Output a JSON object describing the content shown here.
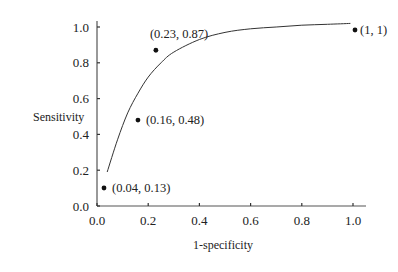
{
  "chart_data": {
    "type": "scatter",
    "title": "",
    "xlabel": "1-specificity",
    "ylabel": "Sensitivity",
    "xlim": [
      0,
      1.0
    ],
    "ylim": [
      0,
      1.0
    ],
    "grid": false,
    "legend": null,
    "x_ticks": [
      "0.0",
      "0.2",
      "0.4",
      "0.6",
      "0.8",
      "1.0"
    ],
    "y_ticks": [
      "0.0",
      "0.2",
      "0.4",
      "0.6",
      "0.8",
      "1.0"
    ],
    "series": [
      {
        "name": "ROC points",
        "type": "scatter",
        "points": [
          {
            "x": 0.04,
            "y": 0.13,
            "label": "(0.04, 0.13)"
          },
          {
            "x": 0.16,
            "y": 0.48,
            "label": "(0.16, 0.48)"
          },
          {
            "x": 0.23,
            "y": 0.87,
            "label": "(0.23, 0.87)"
          },
          {
            "x": 1.0,
            "y": 1.0,
            "label": "(1, 1)"
          }
        ]
      },
      {
        "name": "Fitted ROC curve",
        "type": "line",
        "x": [
          0.04,
          0.08,
          0.12,
          0.16,
          0.2,
          0.25,
          0.3,
          0.4,
          0.5,
          0.6,
          0.7,
          0.8,
          0.9,
          0.99
        ],
        "y": [
          0.19,
          0.37,
          0.52,
          0.63,
          0.72,
          0.8,
          0.86,
          0.93,
          0.97,
          0.99,
          1.0,
          1.01,
          1.015,
          1.02
        ]
      }
    ]
  }
}
